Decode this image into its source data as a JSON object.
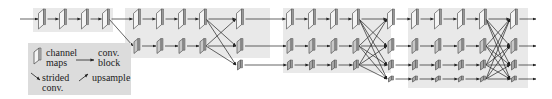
{
  "diagram": {
    "type": "network-architecture",
    "colors": {
      "panel": "#e9e9e9",
      "map_face": "#f4f4f4",
      "map_face_dark": "#a8a8a8",
      "map_edge": "#555555",
      "arrow": "#222222",
      "legend_bg": "#dcdcdc"
    },
    "rows": [
      {
        "name": "row-1-high-res",
        "y": 19,
        "w": 7,
        "h": 20
      },
      {
        "name": "row-2",
        "y": 46,
        "w": 6,
        "h": 15
      },
      {
        "name": "row-3",
        "y": 65,
        "w": 5,
        "h": 10
      },
      {
        "name": "row-4-low-res",
        "y": 79,
        "w": 5,
        "h": 6
      }
    ],
    "panels": [
      {
        "x": 33,
        "y": 8,
        "w": 80,
        "h": 24
      },
      {
        "x": 125,
        "y": 8,
        "w": 145,
        "h": 50
      },
      {
        "x": 283,
        "y": 8,
        "w": 108,
        "h": 65
      },
      {
        "x": 408,
        "y": 8,
        "w": 120,
        "h": 80
      }
    ],
    "maps": [
      {
        "row": 0,
        "x": [
          42,
          63,
          85,
          106,
          137,
          160,
          182,
          203,
          240,
          290,
          312,
          334,
          356,
          391,
          415,
          438,
          461,
          483,
          514
        ]
      },
      {
        "row": 1,
        "x": [
          137,
          160,
          182,
          203,
          240,
          290,
          312,
          334,
          356,
          391,
          415,
          438,
          461,
          483,
          514
        ]
      },
      {
        "row": 2,
        "x": [
          240,
          290,
          312,
          334,
          356,
          391,
          415,
          438,
          461,
          483,
          514
        ]
      },
      {
        "row": 3,
        "x": [
          391,
          415,
          438,
          461,
          483,
          514
        ]
      }
    ],
    "fusions": [
      {
        "from_x": 106,
        "to_x": 137,
        "from_rows": [
          0
        ],
        "to_rows": [
          0,
          1
        ]
      },
      {
        "from_x": 203,
        "to_x": 240,
        "from_rows": [
          0,
          1
        ],
        "to_rows": [
          0,
          1,
          2
        ]
      },
      {
        "from_x": 356,
        "to_x": 391,
        "from_rows": [
          0,
          1,
          2
        ],
        "to_rows": [
          0,
          1,
          2,
          3
        ]
      },
      {
        "from_x": 483,
        "to_x": 514,
        "from_rows": [
          0,
          1,
          2,
          3
        ],
        "to_rows": [
          0,
          1,
          2,
          3
        ]
      }
    ],
    "input_arrow_x": 20,
    "output_arrow_x": 528
  },
  "legend": {
    "channel_maps_line1": "channel",
    "channel_maps_line2": "maps",
    "conv_block_line1": "conv.",
    "conv_block_line2": "block",
    "strided_line1": "strided",
    "strided_line2": "conv.",
    "upsample": "upsample"
  }
}
